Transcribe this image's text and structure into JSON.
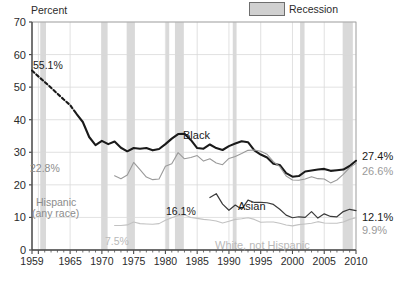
{
  "legend": {
    "recession_label": "Recession",
    "swatch_color": "#d0d0d0"
  },
  "axes": {
    "ylabel": "Percent",
    "yticks": [
      "0",
      "10",
      "20",
      "30",
      "40",
      "50",
      "60",
      "70"
    ],
    "ylim": [
      0,
      70
    ],
    "xticks": [
      "1959",
      "1965",
      "1970",
      "1975",
      "1980",
      "1985",
      "1990",
      "1995",
      "2000",
      "2005",
      "2010"
    ],
    "xlim": [
      1959,
      2010
    ]
  },
  "annotations": {
    "start_black": "55.1%",
    "start_hispanic": "22.8%",
    "start_asian": "16.1%",
    "start_white": "7.5%",
    "end_black": "27.4%",
    "end_hispanic": "26.6%",
    "end_asian": "12.1%",
    "end_white": "9.9%",
    "series_black": "Black",
    "series_hispanic": "Hispanic",
    "series_hispanic_2": "(any race)",
    "series_asian": "Asian",
    "series_white": "White, not Hispanic"
  },
  "chart_data": {
    "type": "line",
    "title": "",
    "xlabel": "",
    "ylabel": "Percent",
    "xlim": [
      1959,
      2010
    ],
    "ylim": [
      0,
      70
    ],
    "grid": true,
    "legend_position": "top-right",
    "legend_entries": [
      "Recession"
    ],
    "colors": {
      "black": "#1a1a1a",
      "hispanic": "#9a9a9a",
      "asian": "#3a3a3a",
      "white_not_hispanic": "#c2c2c2",
      "recession_band": "#d9d9d9",
      "gridline": "#d9d9d9",
      "axis": "#4a4a4a"
    },
    "recession_bands": [
      [
        1960.3,
        1961.2
      ],
      [
        1969.9,
        1970.9
      ],
      [
        1973.9,
        1975.2
      ],
      [
        1980.1,
        1980.6
      ],
      [
        1981.5,
        1982.9
      ],
      [
        1990.6,
        1991.2
      ],
      [
        2001.2,
        2001.9
      ],
      [
        2007.9,
        2009.5
      ]
    ],
    "series": [
      {
        "name": "Black",
        "style": "thick",
        "dashed_until": 1966,
        "x": [
          1959,
          1960,
          1961,
          1962,
          1963,
          1964,
          1965,
          1966,
          1967,
          1968,
          1969,
          1970,
          1971,
          1972,
          1973,
          1974,
          1975,
          1976,
          1977,
          1978,
          1979,
          1980,
          1981,
          1982,
          1983,
          1984,
          1985,
          1986,
          1987,
          1988,
          1989,
          1990,
          1991,
          1992,
          1993,
          1994,
          1995,
          1996,
          1997,
          1998,
          1999,
          2000,
          2001,
          2002,
          2003,
          2004,
          2005,
          2006,
          2007,
          2008,
          2009,
          2010
        ],
        "values": [
          55.1,
          53.3,
          51.6,
          49.8,
          48.0,
          46.2,
          44.5,
          41.8,
          39.3,
          34.7,
          32.2,
          33.5,
          32.5,
          33.3,
          31.4,
          30.3,
          31.3,
          31.1,
          31.3,
          30.6,
          31.0,
          32.5,
          34.2,
          35.6,
          35.7,
          33.8,
          31.3,
          31.1,
          32.4,
          31.3,
          30.7,
          31.9,
          32.7,
          33.4,
          33.1,
          30.6,
          29.3,
          28.4,
          26.5,
          26.1,
          23.6,
          22.5,
          22.7,
          24.1,
          24.4,
          24.7,
          24.9,
          24.3,
          24.5,
          24.7,
          25.8,
          27.4
        ]
      },
      {
        "name": "Hispanic (any race)",
        "style": "thin-gray",
        "x": [
          1972,
          1973,
          1974,
          1975,
          1976,
          1977,
          1978,
          1979,
          1980,
          1981,
          1982,
          1983,
          1984,
          1985,
          1986,
          1987,
          1988,
          1989,
          1990,
          1991,
          1992,
          1993,
          1994,
          1995,
          1996,
          1997,
          1998,
          1999,
          2000,
          2001,
          2002,
          2003,
          2004,
          2005,
          2006,
          2007,
          2008,
          2009,
          2010
        ],
        "values": [
          22.8,
          21.9,
          23.0,
          26.9,
          24.7,
          22.4,
          21.6,
          21.8,
          25.7,
          26.5,
          29.9,
          28.0,
          28.4,
          29.0,
          27.3,
          28.0,
          26.7,
          26.2,
          28.1,
          28.7,
          29.6,
          30.6,
          30.7,
          30.3,
          29.4,
          27.1,
          25.6,
          22.7,
          21.5,
          21.4,
          21.8,
          22.5,
          21.9,
          21.8,
          20.6,
          21.5,
          23.2,
          25.3,
          26.6
        ]
      },
      {
        "name": "Asian",
        "style": "thin-dark",
        "x": [
          1987,
          1988,
          1989,
          1990,
          1991,
          1992,
          1993,
          1994,
          1995,
          1996,
          1997,
          1998,
          1999,
          2000,
          2001,
          2002,
          2003,
          2004,
          2005,
          2006,
          2007,
          2008,
          2009,
          2010
        ],
        "values": [
          16.1,
          17.3,
          14.1,
          12.2,
          13.8,
          12.5,
          15.3,
          14.6,
          14.6,
          14.5,
          14.0,
          12.5,
          10.7,
          9.9,
          10.2,
          10.0,
          11.8,
          9.8,
          11.1,
          10.3,
          10.2,
          11.8,
          12.5,
          12.1
        ]
      },
      {
        "name": "White, not Hispanic",
        "style": "thin-light",
        "x": [
          1972,
          1973,
          1974,
          1975,
          1976,
          1977,
          1978,
          1979,
          1980,
          1981,
          1982,
          1983,
          1984,
          1985,
          1986,
          1987,
          1988,
          1989,
          1990,
          1991,
          1992,
          1993,
          1994,
          1995,
          1996,
          1997,
          1998,
          1999,
          2000,
          2001,
          2002,
          2003,
          2004,
          2005,
          2006,
          2007,
          2008,
          2009,
          2010
        ],
        "values": [
          7.5,
          7.5,
          7.7,
          8.6,
          8.1,
          8.0,
          7.9,
          8.1,
          9.1,
          9.9,
          10.6,
          10.8,
          10.0,
          9.7,
          9.4,
          9.2,
          8.9,
          8.3,
          8.8,
          9.4,
          9.6,
          9.9,
          9.4,
          8.5,
          8.6,
          8.6,
          8.2,
          7.7,
          7.4,
          7.8,
          8.0,
          8.2,
          8.7,
          8.3,
          8.2,
          8.2,
          8.6,
          9.4,
          9.9
        ]
      }
    ]
  }
}
